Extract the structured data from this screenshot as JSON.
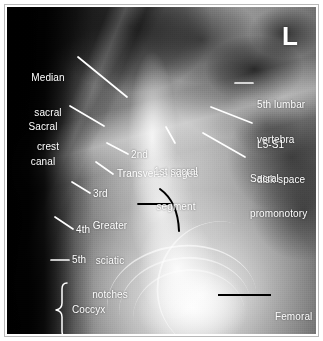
{
  "figure": {
    "kind": "radiograph",
    "modality": "X-ray",
    "view": "lateral sacrum and coccyx",
    "side_marker": "L",
    "frame_color": "#b9b9b9",
    "background_color": "#ffffff",
    "label_color": "#ffffff",
    "dark_leader_color": "#000000"
  },
  "annotations": [
    {
      "id": "median-sacral-crest",
      "label": "Median\nsacral\ncrest",
      "lines": [
        "Median",
        "sacral",
        "crest"
      ],
      "align": "center",
      "leader": "white"
    },
    {
      "id": "sacral-canal",
      "label": "Sacral\ncanal",
      "lines": [
        "Sacral",
        "canal"
      ],
      "align": "center",
      "leader": "white"
    },
    {
      "id": "second-segment",
      "label": "2nd",
      "lines": [
        "2nd"
      ],
      "align": "left",
      "leader": "white"
    },
    {
      "id": "third-segment",
      "label": "3rd",
      "lines": [
        "3rd"
      ],
      "align": "left",
      "leader": "white"
    },
    {
      "id": "fourth-segment",
      "label": "4th",
      "lines": [
        "4th"
      ],
      "align": "left",
      "leader": "white"
    },
    {
      "id": "fifth-segment",
      "label": "5th",
      "lines": [
        "5th"
      ],
      "align": "left",
      "leader": "white"
    },
    {
      "id": "coccyx",
      "label": "Coccyx",
      "lines": [
        "Coccyx"
      ],
      "align": "left",
      "leader": "brace"
    },
    {
      "id": "transverse-ridges",
      "label": "Transverse ridges",
      "lines": [
        "Transverse ridges"
      ],
      "align": "left",
      "leader": "white"
    },
    {
      "id": "greater-sciatic-notches",
      "label": "Greater\nsciatic\nnotches",
      "lines": [
        "Greater",
        "sciatic",
        "notches"
      ],
      "align": "center",
      "leader": "black-arc"
    },
    {
      "id": "first-sacral-segment",
      "label": "1st sacral\nsegment",
      "lines": [
        "1st sacral",
        "segment"
      ],
      "align": "center",
      "leader": "white"
    },
    {
      "id": "fifth-lumbar-vertebra",
      "label": "5th lumbar\nvertebra",
      "lines": [
        "5th lumbar",
        "vertebra"
      ],
      "align": "left",
      "leader": "white"
    },
    {
      "id": "l5-s1-disk-space",
      "label": "L5-S1\ndisk space",
      "lines": [
        "L5-S1",
        "disk space"
      ],
      "align": "left",
      "leader": "white"
    },
    {
      "id": "sacral-promonotory",
      "label": "Sacral\npromonotory",
      "lines": [
        "Sacral",
        "promonotory"
      ],
      "align": "left",
      "leader": "white"
    },
    {
      "id": "femoral-heads",
      "label": "Femoral\nheads",
      "lines": [
        "Femoral",
        "heads"
      ],
      "align": "left",
      "leader": "black"
    }
  ],
  "labels": {
    "median_sacral_crest_1": "Median",
    "median_sacral_crest_2": "sacral",
    "median_sacral_crest_3": "crest",
    "sacral_canal_1": "Sacral",
    "sacral_canal_2": "canal",
    "second": "2nd",
    "third": "3rd",
    "fourth": "4th",
    "fifth": "5th",
    "coccyx": "Coccyx",
    "transverse_ridges": "Transverse ridges",
    "greater_sciatic_1": "Greater",
    "greater_sciatic_2": "sciatic",
    "greater_sciatic_3": "notches",
    "first_sacral_1": "1st sacral",
    "first_sacral_2": "segment",
    "fifth_lumbar_1": "5th lumbar",
    "fifth_lumbar_2": "vertebra",
    "l5s1_1": "L5-S1",
    "l5s1_2": "disk space",
    "promonotory_1": "Sacral",
    "promonotory_2": "promonotory",
    "femoral_1": "Femoral",
    "femoral_2": "heads",
    "side_marker": "L"
  }
}
